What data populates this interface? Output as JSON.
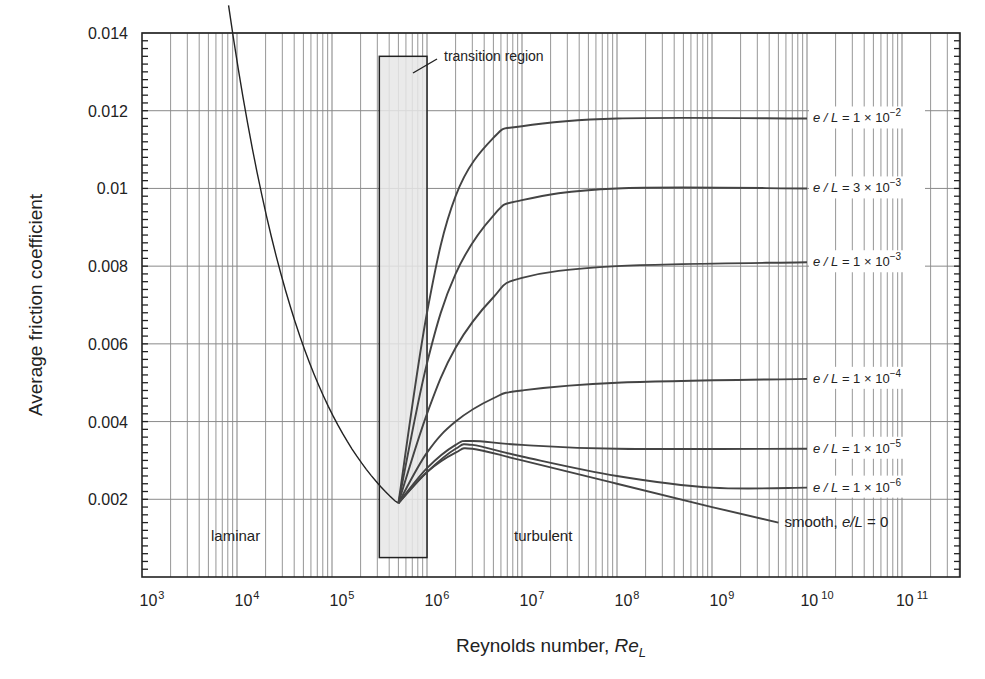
{
  "chart_data": {
    "type": "line",
    "title": "",
    "xlabel": "Reynolds number, Re_L",
    "xlabel_main": "Reynolds number, ",
    "xlabel_italic": "Re",
    "xlabel_sub": "L",
    "ylabel": "Average friction coefficient",
    "xscale": "log",
    "xlim": [
      1000,
      400000000000
    ],
    "ylim": [
      0,
      0.014
    ],
    "grid": true,
    "y_ticks": [
      "0.002",
      "0.004",
      "0.006",
      "0.008",
      "0.01",
      "0.012",
      "0.014"
    ],
    "y_tick_values": [
      0.002,
      0.004,
      0.006,
      0.008,
      0.01,
      0.012,
      0.014
    ],
    "x_ticks": [
      {
        "base": "10",
        "exp": "3"
      },
      {
        "base": "10",
        "exp": "4"
      },
      {
        "base": "10",
        "exp": "5"
      },
      {
        "base": "10",
        "exp": "6"
      },
      {
        "base": "10",
        "exp": "7"
      },
      {
        "base": "10",
        "exp": "8"
      },
      {
        "base": "10",
        "exp": "9"
      },
      {
        "base": "10",
        "exp": "10"
      },
      {
        "base": "10",
        "exp": "11"
      }
    ],
    "annotations": {
      "transition_region": "transition region",
      "laminar": "laminar",
      "turbulent": "turbulent"
    },
    "transition_box": {
      "x_range": [
        300000,
        1000000
      ],
      "y_range": [
        0.0005,
        0.0134
      ]
    },
    "series": [
      {
        "name": "laminar",
        "x": [
          8000,
          10000,
          30000,
          100000,
          300000,
          500000
        ],
        "values": [
          0.0148,
          0.0133,
          0.0077,
          0.0042,
          0.0024,
          0.0019
        ]
      },
      {
        "name": "e/L = 1 × 10^-2",
        "label_pre": "e / L = 1 × 10",
        "label_exp": "−2",
        "x": [
          500000,
          1000000,
          2000000,
          5000000,
          10000000,
          100000000,
          10000000000
        ],
        "values": [
          0.0019,
          0.0068,
          0.0098,
          0.0113,
          0.0116,
          0.0118,
          0.0118
        ]
      },
      {
        "name": "e/L = 3 × 10^-3",
        "label_pre": "e / L = 3 × 10",
        "label_exp": "−3",
        "x": [
          500000,
          1000000,
          2000000,
          5000000,
          10000000,
          100000000,
          10000000000
        ],
        "values": [
          0.0019,
          0.0055,
          0.0078,
          0.0093,
          0.0097,
          0.01,
          0.01
        ]
      },
      {
        "name": "e/L = 1 × 10^-3",
        "label_pre": "e / L = 1 × 10",
        "label_exp": "−3",
        "x": [
          500000,
          1000000,
          2000000,
          5000000,
          10000000,
          100000000,
          10000000000
        ],
        "values": [
          0.0019,
          0.0042,
          0.0059,
          0.0072,
          0.0077,
          0.008,
          0.0081
        ]
      },
      {
        "name": "e/L = 1 × 10^-4",
        "label_pre": "e / L = 1 × 10",
        "label_exp": "−4",
        "x": [
          500000,
          1000000,
          2000000,
          5000000,
          10000000,
          100000000,
          10000000000
        ],
        "values": [
          0.0019,
          0.0032,
          0.004,
          0.0046,
          0.0048,
          0.005,
          0.0051
        ]
      },
      {
        "name": "e/L = 1 × 10^-5",
        "label_pre": "e / L = 1 × 10",
        "label_exp": "−5",
        "x": [
          500000,
          1000000,
          2000000,
          3000000,
          10000000,
          100000000,
          10000000000
        ],
        "values": [
          0.0019,
          0.0028,
          0.0034,
          0.0035,
          0.0034,
          0.0033,
          0.0033
        ]
      },
      {
        "name": "e/L = 1 × 10^-6",
        "label_pre": "e / L = 1 × 10",
        "label_exp": "−6",
        "x": [
          500000,
          1000000,
          2000000,
          3000000,
          10000000,
          100000000,
          1000000000,
          10000000000
        ],
        "values": [
          0.0019,
          0.0027,
          0.0033,
          0.0034,
          0.0031,
          0.0026,
          0.0023,
          0.0023
        ]
      },
      {
        "name": "smooth, e/L = 0",
        "label": "smooth, e/L = 0",
        "x": [
          500000,
          1000000,
          2000000,
          3000000,
          10000000,
          100000000,
          1000000000,
          5000000000
        ],
        "values": [
          0.0019,
          0.0027,
          0.0032,
          0.0033,
          0.003,
          0.0024,
          0.0018,
          0.0014
        ]
      }
    ]
  }
}
